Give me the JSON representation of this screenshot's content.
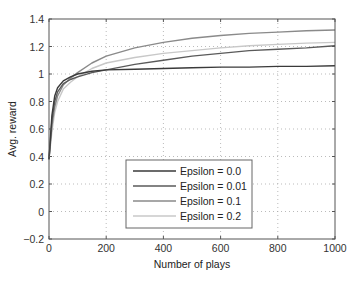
{
  "chart_data": {
    "type": "line",
    "title": "",
    "xlabel": "Number of plays",
    "ylabel": "Avg. reward",
    "xlim": [
      0,
      1000
    ],
    "ylim": [
      -0.2,
      1.4
    ],
    "xticks": [
      0,
      200,
      400,
      600,
      800,
      1000
    ],
    "yticks": [
      -0.2,
      0,
      0.2,
      0.4,
      0.6,
      0.8,
      1,
      1.2,
      1.4
    ],
    "xtick_labels": [
      "0",
      "200",
      "400",
      "600",
      "800",
      "1000"
    ],
    "ytick_labels": [
      "−0.2",
      "0",
      "0.2",
      "0.4",
      "0.6",
      "0.8",
      "1",
      "1.2",
      "1.4"
    ],
    "grid": true,
    "legend_position": "lower center",
    "x": [
      0,
      10,
      20,
      30,
      50,
      75,
      100,
      150,
      200,
      300,
      400,
      500,
      600,
      700,
      800,
      900,
      1000
    ],
    "series": [
      {
        "name": "Epsilon = 0.0",
        "color": "#3a3a3a",
        "values": [
          0.38,
          0.7,
          0.84,
          0.9,
          0.95,
          0.98,
          1.0,
          1.02,
          1.03,
          1.035,
          1.04,
          1.045,
          1.05,
          1.05,
          1.055,
          1.055,
          1.06
        ]
      },
      {
        "name": "Epsilon = 0.01",
        "color": "#5a5a5a",
        "values": [
          0.38,
          0.66,
          0.8,
          0.87,
          0.93,
          0.96,
          0.98,
          1.01,
          1.03,
          1.07,
          1.1,
          1.13,
          1.15,
          1.17,
          1.18,
          1.19,
          1.205
        ]
      },
      {
        "name": "Epsilon = 0.1",
        "color": "#8a8a8a",
        "values": [
          0.38,
          0.62,
          0.76,
          0.84,
          0.92,
          0.97,
          1.01,
          1.08,
          1.13,
          1.19,
          1.23,
          1.26,
          1.28,
          1.295,
          1.305,
          1.315,
          1.32
        ]
      },
      {
        "name": "Epsilon = 0.2",
        "color": "#c8c8c8",
        "values": [
          0.38,
          0.58,
          0.72,
          0.8,
          0.89,
          0.94,
          0.98,
          1.04,
          1.08,
          1.12,
          1.15,
          1.17,
          1.19,
          1.205,
          1.215,
          1.225,
          1.23
        ]
      }
    ]
  },
  "legend": {
    "items": [
      {
        "label": "Epsilon = 0.0"
      },
      {
        "label": "Epsilon = 0.01"
      },
      {
        "label": "Epsilon = 0.1"
      },
      {
        "label": "Epsilon = 0.2"
      }
    ]
  }
}
